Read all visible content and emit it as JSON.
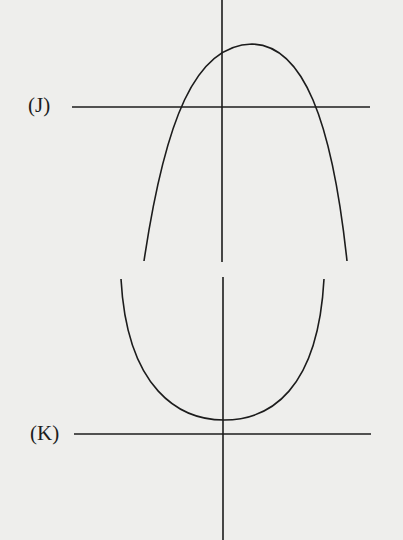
{
  "figures": [
    {
      "id": "J",
      "label": "(J)",
      "description": "Downward-opening parabola with vertex right of the y-axis, above the x-axis; intersects x-axis twice",
      "axis_x": {
        "y": 107,
        "x1": 72,
        "x2": 370
      },
      "axis_y": {
        "x": 222,
        "y1": 0,
        "y2": 262
      },
      "curve": "M144,261 C165,120 195,45 252,44 C303,45 332,120 347,261",
      "label_pos": {
        "x": 28,
        "y": 95
      }
    },
    {
      "id": "K",
      "label": "(K)",
      "description": "Upward-opening U-shaped curve with minimum near the y-axis, entirely above the x-axis",
      "axis_x": {
        "y": 434,
        "x1": 74,
        "x2": 371
      },
      "axis_y": {
        "x": 223,
        "y1": 277,
        "y2": 540
      },
      "curve": "M121,279 C127,390 180,420 224,420 C270,420 318,390 324,279",
      "label_pos": {
        "x": 30,
        "y": 423
      }
    }
  ],
  "colors": {
    "background": "#eeeeec",
    "stroke": "#1c1c1c"
  }
}
